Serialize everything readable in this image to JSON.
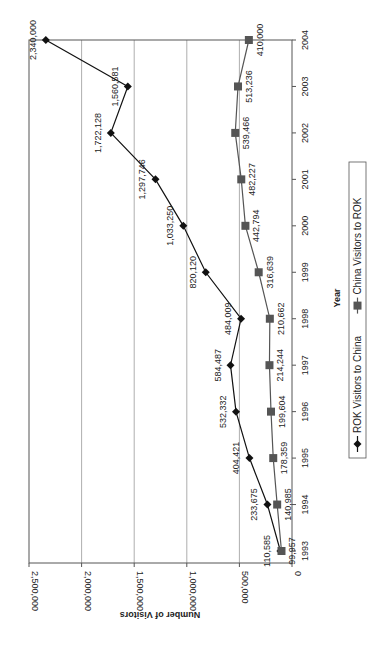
{
  "chart_data": {
    "type": "line",
    "orientation": "rotated-90-clockwise",
    "title": "",
    "xlabel": "Year",
    "ylabel": "Number of Visitors",
    "x": [
      1993,
      1994,
      1995,
      1996,
      1997,
      1998,
      1999,
      2000,
      2001,
      2002,
      2003,
      2004
    ],
    "ylim": [
      0,
      2500000
    ],
    "yticks": [
      0,
      500000,
      1000000,
      1500000,
      2000000,
      2500000
    ],
    "ytick_labels": [
      "0",
      "500,000",
      "1,000,000",
      "1,500,000",
      "2,000,000",
      "2,500,000"
    ],
    "grid": true,
    "legend_position": "bottom",
    "series": [
      {
        "name": "ROK Visitors to China",
        "marker": "diamond",
        "color": "#111111",
        "values": [
          110585,
          233675,
          404421,
          532332,
          584487,
          484009,
          820120,
          1033250,
          1297746,
          1722128,
          1560581,
          2340000
        ],
        "labels": [
          "110,585",
          "233,675",
          "404,421",
          "532,332",
          "584,487",
          "484,009",
          "820,120",
          "1,033,250",
          "1,297,746",
          "1,722,128",
          "1,560,581",
          "2,340,000"
        ]
      },
      {
        "name": "China Visitors to ROK",
        "marker": "square",
        "color": "#555555",
        "values": [
          99957,
          140985,
          178359,
          199604,
          214244,
          210662,
          316639,
          442794,
          482227,
          539466,
          513236,
          410000
        ],
        "labels": [
          "99,957",
          "140,985",
          "178,359",
          "199,604",
          "214,244",
          "210,662",
          "316,639",
          "442,794",
          "482,227",
          "539,466",
          "513,236",
          "410,000"
        ]
      }
    ]
  }
}
